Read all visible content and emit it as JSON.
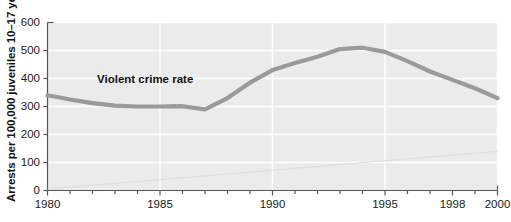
{
  "chart_data": {
    "type": "line",
    "title": "",
    "xlabel": "",
    "ylabel": "Arrests per 100,000 juveniles 10–17 years",
    "xlim": [
      1980,
      2000
    ],
    "ylim": [
      0,
      600
    ],
    "grid": true,
    "legend": "none",
    "y_ticks": [
      600,
      500,
      400,
      300,
      200,
      100,
      0
    ],
    "y_tick_labels": [
      "600",
      "500",
      "400",
      "300",
      "200",
      "100",
      "0"
    ],
    "x_ticks": [
      1980,
      1985,
      1990,
      1995,
      1998,
      2000
    ],
    "x_tick_labels": [
      "1980",
      "1985",
      "1990",
      "1995",
      "1998",
      "2000"
    ],
    "x_minor_ticks": [
      1980,
      1981,
      1982,
      1983,
      1984,
      1985,
      1986,
      1987,
      1988,
      1989,
      1990,
      1991,
      1992,
      1993,
      1994,
      1995,
      1996,
      1997,
      1998,
      1999,
      2000
    ],
    "annotations": [
      {
        "text": "Violent crime rate",
        "x": 1982.2,
        "y": 395,
        "bold": true,
        "color": "#111111"
      }
    ],
    "series": [
      {
        "name": "Violent crime rate",
        "color": "#9a9a9a",
        "linewidth": 4.2,
        "x": [
          1980,
          1981,
          1982,
          1983,
          1984,
          1985,
          1986,
          1987,
          1988,
          1989,
          1990,
          1991,
          1992,
          1993,
          1994,
          1995,
          1996,
          1997,
          1998,
          1999,
          2000
        ],
        "values": [
          340,
          325,
          312,
          303,
          300,
          300,
          301,
          290,
          330,
          385,
          430,
          455,
          478,
          505,
          510,
          495,
          462,
          425,
          395,
          365,
          330
        ]
      },
      {
        "name": "background-trend-line",
        "color": "#dcdcdc",
        "linewidth": 1,
        "x": [
          1980,
          2000
        ],
        "values": [
          5,
          140
        ]
      }
    ]
  },
  "axes": {
    "axis_color": "#555555",
    "grid_color": "#ffffff",
    "plot_background": "#ebebeb",
    "page_background": "#ffffff"
  }
}
